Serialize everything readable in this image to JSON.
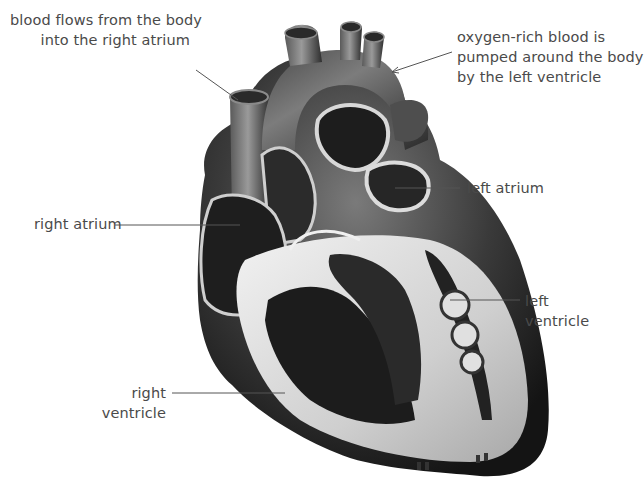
{
  "diagram": {
    "colors": {
      "background": "#ffffff",
      "label_text": "#4a4a4a",
      "leader_line": "#555555",
      "heart_dark": "#1c1c1c",
      "heart_mid": "#6e6e6e",
      "heart_light": "#d9d9d9"
    },
    "labels": [
      {
        "id": "vena-cava",
        "line1": "blood flows from the body",
        "line2": "into the right atrium"
      },
      {
        "id": "aorta",
        "line1": "oxygen-rich blood is",
        "line2": "pumped around the body",
        "line3": "by the left ventricle"
      },
      {
        "id": "left-atrium",
        "line1": "left atrium"
      },
      {
        "id": "right-atrium",
        "line1": "right atrium"
      },
      {
        "id": "left-ventricle",
        "line1": "left",
        "line2": "ventricle"
      },
      {
        "id": "right-ventricle",
        "line1": "right",
        "line2": "ventricle"
      }
    ]
  }
}
